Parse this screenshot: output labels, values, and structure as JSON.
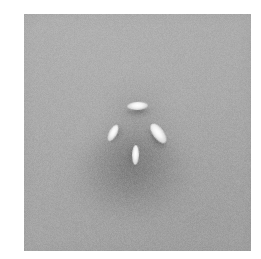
{
  "figure": {
    "kind": "grayscale-scientific-image",
    "canvas_width": 261,
    "canvas_height": 259,
    "page_background": "#ffffff",
    "image_background": "#a9a9a9"
  },
  "image_area": {
    "label": "image-area",
    "left": 24,
    "top": 14,
    "width": 227,
    "height": 237,
    "mean_gray": "#a9a9a9",
    "noise": "fine-grain speckle"
  },
  "chart_data": {
    "type": "heatmap",
    "title": "",
    "xlabel": "",
    "ylabel": "",
    "colormap": "grayscale",
    "value_range": [
      0,
      255
    ],
    "background_value": 169,
    "axis_ranges": {
      "x": [
        0,
        227
      ],
      "y": [
        0,
        237
      ]
    },
    "grid": false,
    "legend": "none",
    "features": [
      {
        "name": "top-feature",
        "shape": "ellipse",
        "cx": 113,
        "cy": 92,
        "rx": 10.5,
        "ry": 4,
        "angle_deg": -3,
        "peak_value": 255,
        "shadow_value": 45,
        "shadow_offset": [
          0,
          5
        ]
      },
      {
        "name": "left-feature",
        "shape": "ellipse",
        "cx": 89,
        "cy": 119,
        "rx": 4,
        "ry": 9,
        "angle_deg": 28,
        "peak_value": 250,
        "shadow_value": 50,
        "shadow_offset": [
          3,
          -2
        ]
      },
      {
        "name": "right-feature",
        "shape": "ellipse",
        "cx": 134,
        "cy": 119,
        "rx": 5.5,
        "ry": 11.5,
        "angle_deg": -36,
        "peak_value": 255,
        "shadow_value": 40,
        "shadow_offset": [
          -5,
          1
        ]
      },
      {
        "name": "bottom-feature",
        "shape": "ellipse",
        "cx": 111,
        "cy": 141,
        "rx": 3.5,
        "ry": 10,
        "angle_deg": 2,
        "peak_value": 252,
        "shadow_value": 55,
        "shadow_offset": [
          -4,
          0
        ]
      }
    ],
    "diffuse_regions": [
      {
        "name": "primary-dark-halo",
        "cx": 108,
        "cy": 161,
        "rx": 56,
        "ry": 43,
        "min_value": 118,
        "blur": 7
      },
      {
        "name": "secondary-dark-halo",
        "cx": 113,
        "cy": 131,
        "rx": 43,
        "ry": 35,
        "min_value": 140,
        "blur": 9
      },
      {
        "name": "upper-dark-halo",
        "cx": 114,
        "cy": 94,
        "rx": 30,
        "ry": 24,
        "min_value": 152,
        "blur": 8
      }
    ]
  }
}
